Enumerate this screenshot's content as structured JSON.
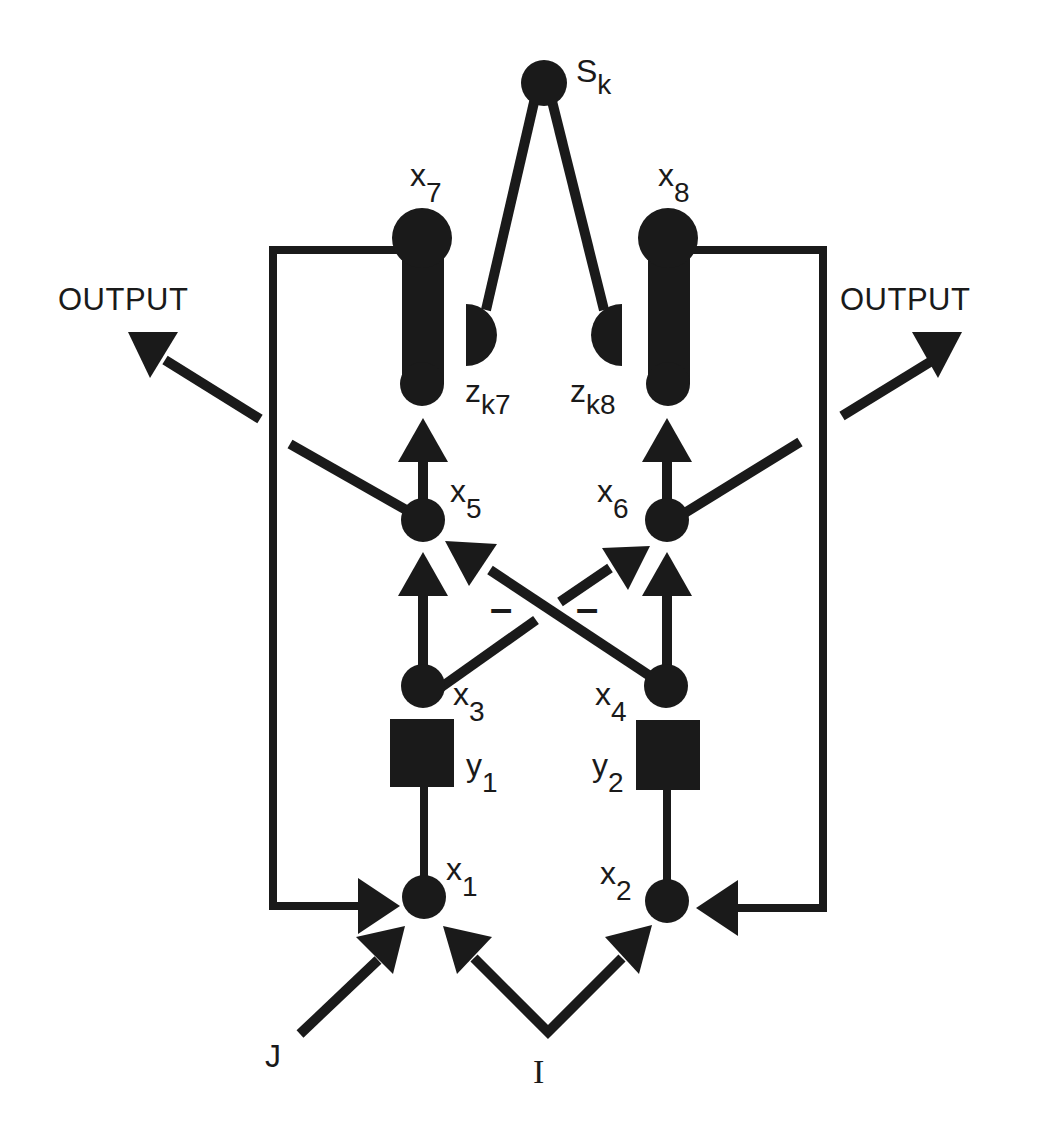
{
  "diagram": {
    "colors": {
      "ink": "#1a1a1a",
      "background": "#ffffff"
    },
    "nodes": {
      "sk": {
        "label_main": "S",
        "label_sub": "k"
      },
      "x1": {
        "label_main": "x",
        "label_sub": "1"
      },
      "x2": {
        "label_main": "x",
        "label_sub": "2"
      },
      "x3": {
        "label_main": "x",
        "label_sub": "3"
      },
      "x4": {
        "label_main": "x",
        "label_sub": "4"
      },
      "x5": {
        "label_main": "x",
        "label_sub": "5"
      },
      "x6": {
        "label_main": "x",
        "label_sub": "6"
      },
      "x7": {
        "label_main": "x",
        "label_sub": "7"
      },
      "x8": {
        "label_main": "x",
        "label_sub": "8"
      },
      "y1": {
        "label_main": "y",
        "label_sub": "1"
      },
      "y2": {
        "label_main": "y",
        "label_sub": "2"
      },
      "zk7": {
        "label_main": "z",
        "label_sub": "k7"
      },
      "zk8": {
        "label_main": "z",
        "label_sub": "k8"
      }
    },
    "outputs": {
      "left": "OUTPUT",
      "right": "OUTPUT"
    },
    "inputs": {
      "j": "J",
      "i": "I"
    },
    "inhibitory_signs": {
      "left": "–",
      "right": "–"
    }
  }
}
